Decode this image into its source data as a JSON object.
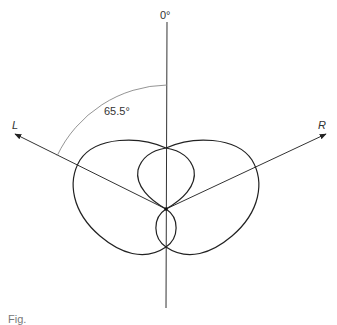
{
  "diagram": {
    "type": "polar-pickup-pattern",
    "labels": {
      "zero": "0°",
      "left": "L",
      "right": "R",
      "angle": "65.5°"
    },
    "angle_degrees": 65.5,
    "colors": {
      "line": "#222222",
      "arc": "#888888",
      "background": "#ffffff"
    }
  },
  "caption": {
    "text": "Fig."
  }
}
